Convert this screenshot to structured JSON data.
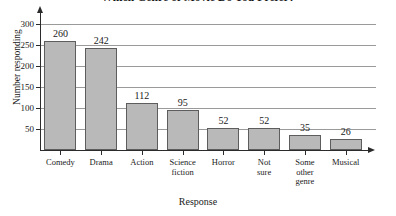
{
  "chart_data": {
    "type": "bar",
    "title": "Which Genre of Movie Do You Prefer?",
    "xlabel": "Response",
    "ylabel": "Number responding",
    "categories": [
      "Comedy",
      "Drama",
      "Action",
      "Science fiction",
      "Horror",
      "Not sure",
      "Some other genre",
      "Musical"
    ],
    "category_lines": [
      [
        "Comedy"
      ],
      [
        "Drama"
      ],
      [
        "Action"
      ],
      [
        "Science",
        "fiction"
      ],
      [
        "Horror"
      ],
      [
        "Not",
        "sure"
      ],
      [
        "Some",
        "other",
        "genre"
      ],
      [
        "Musical"
      ]
    ],
    "values": [
      260,
      242,
      112,
      95,
      52,
      52,
      35,
      26
    ],
    "ylim": [
      0,
      300
    ],
    "yticks": [
      50,
      100,
      150,
      200,
      250,
      300
    ],
    "ytick_labels": [
      "50",
      "100",
      "150",
      "200",
      "250",
      "300"
    ],
    "grid": true,
    "legend": false,
    "bar_color": "#b9b9b9",
    "bar_border_color": "#5d5d5d",
    "axis_color": "#2b2b2b",
    "grid_color": "#9a9a9a"
  }
}
